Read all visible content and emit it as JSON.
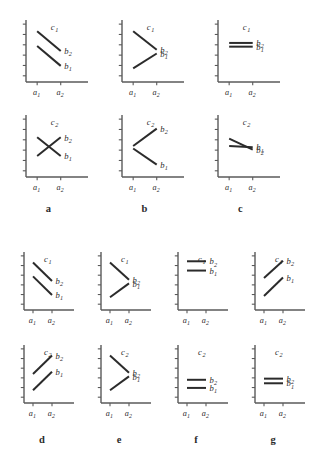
{
  "figure": {
    "background": "#ffffff",
    "axis_color": "#5a5a5a",
    "line_color": "#2b2b2b",
    "label_color": "#2b2b2b",
    "axis_tick_count_y": 6,
    "axis_tick_count_x": 2
  },
  "axis_labels": {
    "x1": "a",
    "x1_sub": "1",
    "x2": "a",
    "x2_sub": "2",
    "series1": "b",
    "series1_sub": "1",
    "series2": "b",
    "series2_sub": "2",
    "level1": "c",
    "level1_sub": "1",
    "level2": "c",
    "level2_sub": "2"
  },
  "panel_captions": [
    {
      "id": "a",
      "label": "a"
    },
    {
      "id": "b",
      "label": "b"
    },
    {
      "id": "c",
      "label": "c"
    },
    {
      "id": "d",
      "label": "d"
    },
    {
      "id": "e",
      "label": "e"
    },
    {
      "id": "f",
      "label": "f"
    },
    {
      "id": "g",
      "label": "g"
    }
  ],
  "chart_data": {
    "type": "line",
    "xlabel": "a",
    "ylabel": "",
    "x": [
      "a1",
      "a2"
    ],
    "xlim": [
      0,
      1
    ],
    "ylim": [
      0,
      1
    ],
    "grid": false,
    "legend": [
      "b1",
      "b2"
    ],
    "legend_position": "inline-right",
    "panels": [
      {
        "id": "a",
        "caption": "a",
        "subplots": [
          {
            "level": "c1",
            "series": [
              {
                "name": "b2",
                "values": [
                  0.82,
                  0.5
                ]
              },
              {
                "name": "b1",
                "values": [
                  0.58,
                  0.26
                ]
              }
            ]
          },
          {
            "level": "c2",
            "series": [
              {
                "name": "b2",
                "values": [
                  0.34,
                  0.64
                ]
              },
              {
                "name": "b1",
                "values": [
                  0.64,
                  0.34
                ]
              }
            ]
          }
        ]
      },
      {
        "id": "b",
        "caption": "b",
        "subplots": [
          {
            "level": "c1",
            "series": [
              {
                "name": "b2",
                "values": [
                  0.82,
                  0.52
                ]
              },
              {
                "name": "b1",
                "values": [
                  0.22,
                  0.46
                ]
              }
            ]
          },
          {
            "level": "c2",
            "series": [
              {
                "name": "b2",
                "values": [
                  0.5,
                  0.78
                ]
              },
              {
                "name": "b1",
                "values": [
                  0.46,
                  0.2
                ]
              }
            ]
          }
        ]
      },
      {
        "id": "c",
        "caption": "c",
        "subplots": [
          {
            "level": "c1",
            "series": [
              {
                "name": "b2",
                "values": [
                  0.63,
                  0.63
                ]
              },
              {
                "name": "b1",
                "values": [
                  0.57,
                  0.57
                ]
              }
            ]
          },
          {
            "level": "c2",
            "series": [
              {
                "name": "b2",
                "values": [
                  0.62,
                  0.44
                ]
              },
              {
                "name": "b1",
                "values": [
                  0.5,
                  0.48
                ]
              }
            ]
          }
        ]
      },
      {
        "id": "d",
        "caption": "d",
        "subplots": [
          {
            "level": "c1",
            "series": [
              {
                "name": "b2",
                "values": [
                  0.82,
                  0.5
                ]
              },
              {
                "name": "b1",
                "values": [
                  0.58,
                  0.26
                ]
              }
            ]
          },
          {
            "level": "c2",
            "series": [
              {
                "name": "b2",
                "values": [
                  0.5,
                  0.82
                ]
              },
              {
                "name": "b1",
                "values": [
                  0.22,
                  0.54
                ]
              }
            ]
          }
        ]
      },
      {
        "id": "e",
        "caption": "e",
        "subplots": [
          {
            "level": "c1",
            "series": [
              {
                "name": "b2",
                "values": [
                  0.82,
                  0.52
                ]
              },
              {
                "name": "b1",
                "values": [
                  0.22,
                  0.46
                ]
              }
            ]
          },
          {
            "level": "c2",
            "series": [
              {
                "name": "b2",
                "values": [
                  0.82,
                  0.52
                ]
              },
              {
                "name": "b1",
                "values": [
                  0.22,
                  0.46
                ]
              }
            ]
          }
        ]
      },
      {
        "id": "f",
        "caption": "f",
        "subplots": [
          {
            "level": "c1",
            "series": [
              {
                "name": "b2",
                "values": [
                  0.84,
                  0.84
                ]
              },
              {
                "name": "b1",
                "values": [
                  0.68,
                  0.68
                ]
              }
            ]
          },
          {
            "level": "c2",
            "series": [
              {
                "name": "b2",
                "values": [
                  0.4,
                  0.4
                ]
              },
              {
                "name": "b1",
                "values": [
                  0.26,
                  0.26
                ]
              }
            ]
          }
        ]
      },
      {
        "id": "g",
        "caption": "g",
        "subplots": [
          {
            "level": "c1",
            "series": [
              {
                "name": "b2",
                "values": [
                  0.55,
                  0.85
                ]
              },
              {
                "name": "b1",
                "values": [
                  0.24,
                  0.56
                ]
              }
            ]
          },
          {
            "level": "c2",
            "series": [
              {
                "name": "b2",
                "values": [
                  0.42,
                  0.42
                ]
              },
              {
                "name": "b1",
                "values": [
                  0.34,
                  0.34
                ]
              }
            ]
          }
        ]
      }
    ]
  }
}
